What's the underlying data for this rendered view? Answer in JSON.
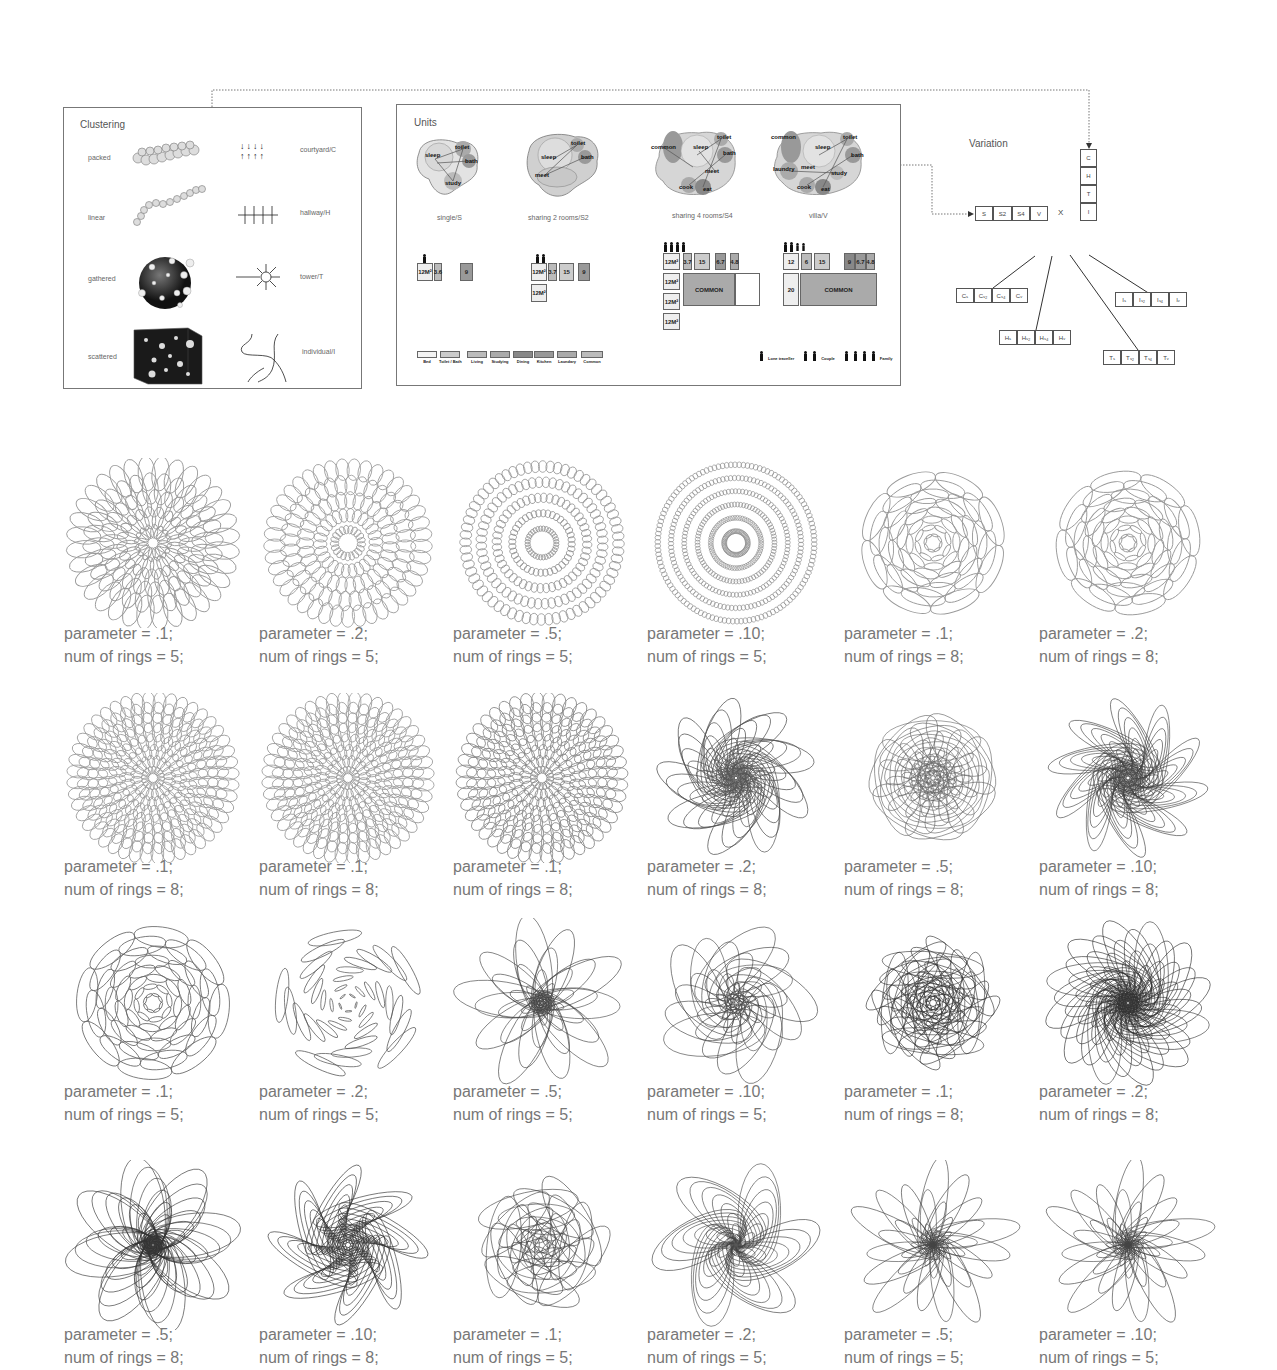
{
  "clustering": {
    "title": "Clustering",
    "items": [
      {
        "label": "packed",
        "pattern_label": "courtyard/C"
      },
      {
        "label": "linear",
        "pattern_label": "hallway/H"
      },
      {
        "label": "gathered",
        "pattern_label": "tower/T"
      },
      {
        "label": "scattered",
        "pattern_label": "individual/I"
      }
    ]
  },
  "units": {
    "title": "Units",
    "types": [
      {
        "label": "single/S",
        "bubbles": [
          "sleep",
          "toilet",
          "bath",
          "study"
        ]
      },
      {
        "label": "sharing 2 rooms/S2",
        "bubbles": [
          "sleep",
          "toilet",
          "bath",
          "meet"
        ]
      },
      {
        "label": "sharing 4 rooms/S4",
        "bubbles": [
          "common",
          "sleep",
          "toilet",
          "bath",
          "meet",
          "cook",
          "eat"
        ]
      },
      {
        "label": "villa/V",
        "bubbles": [
          "common",
          "sleep",
          "toilet",
          "bath",
          "laundry",
          "meet",
          "study",
          "cook",
          "eat"
        ]
      }
    ],
    "plans": {
      "single": {
        "rooms": [
          "12M²",
          "3.6",
          "9"
        ]
      },
      "sharing2": {
        "rooms": [
          "12M²",
          "3.7",
          "15",
          "9",
          "12M²"
        ]
      },
      "sharing4": {
        "rooms": [
          "12M²",
          "3.7",
          "15",
          "6.7",
          "4.8",
          "12M²",
          "12M²",
          "12M²",
          "COMMON"
        ]
      },
      "villa": {
        "rooms": [
          "12",
          "6",
          "15",
          "9",
          "6.7",
          "4.8",
          "20",
          "COMMON"
        ]
      }
    },
    "legend": [
      "Bed",
      "Toilet / Bath",
      "Living",
      "Studying",
      "Dining",
      "Kitchen",
      "Laundary",
      "Common"
    ],
    "occupants": [
      "Lone traveller",
      "Couple",
      "Family"
    ]
  },
  "variation": {
    "title": "Variation",
    "unit_row": [
      "S",
      "S2",
      "S4",
      "V"
    ],
    "operator": "X",
    "cluster_col": [
      "C",
      "H",
      "T",
      "I"
    ],
    "results": {
      "C": [
        "Cₛ",
        "Cₛ₂",
        "Cₛ₄",
        "Cᵥ"
      ],
      "H": [
        "Hₛ",
        "Hₛ₂",
        "Hₛ₄",
        "Hᵥ"
      ],
      "T": [
        "Tₛ",
        "Tₛ₂",
        "Tₛ₄",
        "Tᵥ"
      ],
      "I": [
        "Iₛ",
        "Iₛ₂",
        "Iₛ₄",
        "Iᵥ"
      ]
    }
  },
  "figures": [
    {
      "parameter": "parameter = .1;",
      "rings": "num of rings = 5;"
    },
    {
      "parameter": "parameter = .2;",
      "rings": "num of rings = 5;"
    },
    {
      "parameter": "parameter = .5;",
      "rings": "num of rings = 5;"
    },
    {
      "parameter": "parameter = .10;",
      "rings": "num of rings = 5;"
    },
    {
      "parameter": "parameter = .1;",
      "rings": "num of rings = 8;"
    },
    {
      "parameter": "parameter = .2;",
      "rings": "num of rings = 8;"
    },
    {
      "parameter": "parameter = .1;",
      "rings": "num of rings = 8;"
    },
    {
      "parameter": "parameter = .1;",
      "rings": "num of rings = 8;"
    },
    {
      "parameter": "parameter = .1;",
      "rings": "num of rings = 8;"
    },
    {
      "parameter": "parameter = .2;",
      "rings": "num of rings = 8;"
    },
    {
      "parameter": "parameter = .5;",
      "rings": "num of rings = 8;"
    },
    {
      "parameter": "parameter = .10;",
      "rings": "num of rings = 8;"
    },
    {
      "parameter": "parameter = .1;",
      "rings": "num of rings = 5;"
    },
    {
      "parameter": "parameter = .2;",
      "rings": "num of rings = 5;"
    },
    {
      "parameter": "parameter = .5;",
      "rings": "num of rings = 5;"
    },
    {
      "parameter": "parameter = .10;",
      "rings": "num of rings = 5;"
    },
    {
      "parameter": "parameter = .1;",
      "rings": "num of rings = 8;"
    },
    {
      "parameter": "parameter = .2;",
      "rings": "num of rings = 8;"
    },
    {
      "parameter": "parameter = .5;",
      "rings": "num of rings = 8;"
    },
    {
      "parameter": "parameter = .10;",
      "rings": "num of rings = 8;"
    },
    {
      "parameter": "parameter = .1;",
      "rings": "num of rings = 5;"
    },
    {
      "parameter": "parameter = .2;",
      "rings": "num of rings = 5;"
    },
    {
      "parameter": "parameter = .5;",
      "rings": "num of rings = 5;"
    },
    {
      "parameter": "parameter = .10;",
      "rings": "num of rings = 5;"
    }
  ]
}
